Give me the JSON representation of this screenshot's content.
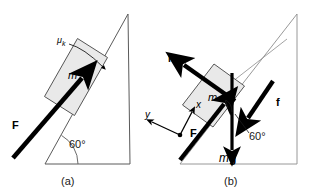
{
  "figure": {
    "width": 315,
    "height": 196,
    "background": "#ffffff",
    "line_color": "#4d4d4d",
    "arrow_color": "#000000",
    "block_fill": "#e8e8e8",
    "block_stroke": "#555555"
  },
  "panel_a": {
    "caption": "(a)",
    "incline_angle": "60°",
    "friction_coefficient": "μ",
    "friction_coefficient_sub": "k",
    "mass_label": "m",
    "applied_force_label": "F",
    "incline_angle_value": 60,
    "triangle": {
      "apex": [
        128,
        14
      ],
      "bottom_left": [
        45,
        164
      ],
      "bottom_right": [
        130,
        164
      ]
    }
  },
  "panel_b": {
    "caption": "(b)",
    "normal_force_label": "N",
    "friction_force_label": "f",
    "applied_force_label": "F",
    "weight_label_m": "m",
    "weight_label_g": "g",
    "mass_label": "m",
    "angle_label": "60°",
    "axis_x_label": "x",
    "axis_y_label": "y",
    "incline_angle_value": 60,
    "triangle": {
      "apex": [
        297,
        14
      ],
      "bottom_left": [
        180,
        164
      ],
      "bottom_right": [
        297,
        164
      ]
    }
  }
}
